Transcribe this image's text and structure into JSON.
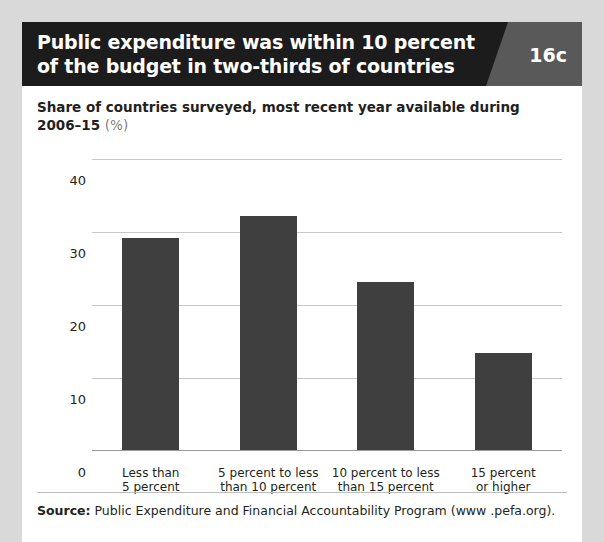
{
  "header": {
    "title": "Public expenditure was within 10 percent of the budget in two-thirds of countries",
    "badge": "16c"
  },
  "subtitle": {
    "text": "Share of countries surveyed, most recent year available during 2006–15 ",
    "unit": "(%)"
  },
  "source": {
    "label": "Source:",
    "text": " Public Expenditure and Financial Accountability Program (www .pefa.org)."
  },
  "colors": {
    "bar": "#3f3f3f",
    "header_bg": "#1c1c1c",
    "badge_bg": "#595959",
    "page_bg": "#d9d9d9",
    "card_bg": "#ffffff",
    "grid": "#c8c8c8"
  },
  "chart_data": {
    "type": "bar",
    "title": "Public expenditure was within 10 percent of the budget in two-thirds of countries",
    "subtitle": "Share of countries surveyed, most recent year available during 2006–15 (%)",
    "categories": [
      "Less than\n5 percent",
      "5 percent to less\nthan 10 percent",
      "10 percent to less\nthan 15 percent",
      "15 percent\nor higher"
    ],
    "values": [
      29,
      32,
      23,
      13.3
    ],
    "xlabel": "",
    "ylabel": "",
    "ylim": [
      0,
      40
    ],
    "yticks": [
      0,
      10,
      20,
      30,
      40
    ],
    "ytick_labels": [
      "0",
      "10",
      "20",
      "30",
      "40"
    ],
    "grid": true,
    "legend": false,
    "series": [
      {
        "name": "Share of countries surveyed",
        "values": [
          29,
          32,
          23,
          13.3
        ]
      }
    ]
  }
}
